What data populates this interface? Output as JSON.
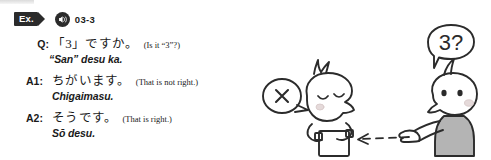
{
  "header": {
    "example_tag": "Ex.",
    "audio_icon": "speaker-icon",
    "track_number": "03-3"
  },
  "dialogue": [
    {
      "speaker": "Q:",
      "japanese_prefix": "「",
      "japanese_number": "3",
      "japanese_suffix": "」ですか。",
      "gloss": "(Is it “3”?)",
      "romaji": "“San” desu ka."
    },
    {
      "speaker": "A1:",
      "japanese": "ちがいます。",
      "gloss": "(That is not right.)",
      "romaji": "Chigaimasu."
    },
    {
      "speaker": "A2:",
      "japanese": "そうです。",
      "gloss": "(That is right.)",
      "romaji": "Sō desu."
    }
  ],
  "illustration": {
    "name": "two-characters-pointing-cartoon",
    "question_bubble_text": "3?",
    "negation_bubble_symbol": "✕",
    "left_character": "character-with-closed-eyes-holding-card",
    "right_character": "character-pointing",
    "arrow": "dashed-arrow-pointing-left",
    "colors": {
      "ink": "#2b2b2b",
      "shirt_gray": "#b4b4b4",
      "cheek": "#e8d6d6"
    }
  }
}
